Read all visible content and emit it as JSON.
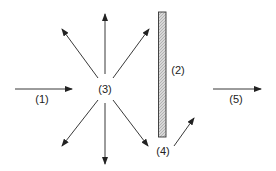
{
  "diagram": {
    "type": "scattering-diagram",
    "labels": {
      "incident": "(1)",
      "plate": "(2)",
      "scatter_center": "(3)",
      "reflected": "(4)",
      "transmitted": "(5)"
    },
    "colors": {
      "stroke": "#222222",
      "plate_fill": "#d4d4d4",
      "background": "#ffffff"
    }
  }
}
